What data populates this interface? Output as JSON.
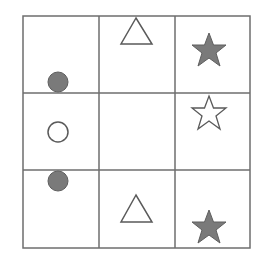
{
  "puzzle": {
    "rows": 3,
    "cols": 3,
    "colors": {
      "grid_line": "#6e6e6e",
      "fill": "#7a7a7a",
      "outline": "#5a5a5a",
      "background": "#ffffff"
    },
    "cells": [
      {
        "row": 0,
        "col": 0,
        "shape": "circle",
        "fill": "filled",
        "position": "bottom-center"
      },
      {
        "row": 0,
        "col": 1,
        "shape": "triangle",
        "fill": "outline",
        "position": "top-center"
      },
      {
        "row": 0,
        "col": 2,
        "shape": "star",
        "fill": "filled",
        "position": "center"
      },
      {
        "row": 1,
        "col": 0,
        "shape": "circle",
        "fill": "outline",
        "position": "center"
      },
      {
        "row": 1,
        "col": 1,
        "shape": "none"
      },
      {
        "row": 1,
        "col": 2,
        "shape": "star",
        "fill": "outline",
        "position": "top-center"
      },
      {
        "row": 2,
        "col": 0,
        "shape": "circle",
        "fill": "filled",
        "position": "top-center"
      },
      {
        "row": 2,
        "col": 1,
        "shape": "triangle",
        "fill": "outline",
        "position": "center"
      },
      {
        "row": 2,
        "col": 2,
        "shape": "star",
        "fill": "filled",
        "position": "bottom-center"
      }
    ]
  }
}
